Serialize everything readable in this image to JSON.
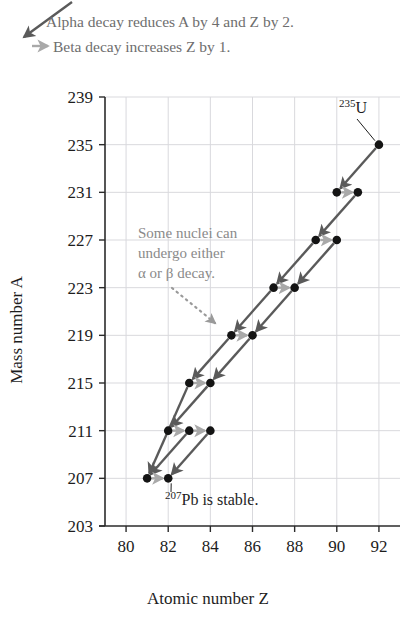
{
  "figure": {
    "legend": [
      {
        "id": "alpha",
        "icon": "alpha-decay-arrow-icon",
        "text": "Alpha decay reduces A by 4 and Z by 2.",
        "color": "#5a5a5a"
      },
      {
        "id": "beta",
        "icon": "beta-decay-arrow-icon",
        "text": "Beta decay increases Z by 1.",
        "color": "#a9a9a9"
      }
    ],
    "annotation": {
      "lines": [
        "Some nuclei can",
        "undergo either",
        "α or β decay."
      ],
      "color": "#8a8a8a",
      "points_to": {
        "Z": 85,
        "A": 219
      }
    },
    "callouts": [
      {
        "id": "u235",
        "sup": "235",
        "symbol": "U",
        "suffix": "",
        "Z": 92,
        "A": 235
      },
      {
        "id": "pb207",
        "sup": "207",
        "symbol": "Pb",
        "suffix": " is stable.",
        "Z": 82,
        "A": 207
      }
    ],
    "colors": {
      "alpha": "#5a5a5a",
      "beta": "#a9a9a9",
      "dot": "#141414",
      "grid": "#d9d9dd",
      "axis": "#2b2b2b",
      "annotation": "#8a8a8a"
    }
  },
  "chart_data": {
    "type": "scatter",
    "title": "",
    "xlabel": "Atomic number Z",
    "ylabel": "Mass number A",
    "xlim": [
      79,
      93
    ],
    "ylim": [
      203,
      239
    ],
    "xticks": [
      80,
      82,
      84,
      86,
      88,
      90,
      92
    ],
    "yticks": [
      203,
      207,
      211,
      215,
      219,
      223,
      227,
      231,
      235,
      239
    ],
    "grid": true,
    "legend_position": "above-plot",
    "points": [
      {
        "Z": 92,
        "A": 235,
        "label": "235U"
      },
      {
        "Z": 90,
        "A": 231,
        "label": ""
      },
      {
        "Z": 91,
        "A": 231,
        "label": ""
      },
      {
        "Z": 89,
        "A": 227,
        "label": ""
      },
      {
        "Z": 90,
        "A": 227,
        "label": ""
      },
      {
        "Z": 87,
        "A": 223,
        "label": ""
      },
      {
        "Z": 88,
        "A": 223,
        "label": ""
      },
      {
        "Z": 85,
        "A": 219,
        "label": ""
      },
      {
        "Z": 86,
        "A": 219,
        "label": ""
      },
      {
        "Z": 83,
        "A": 215,
        "label": ""
      },
      {
        "Z": 84,
        "A": 215,
        "label": ""
      },
      {
        "Z": 82,
        "A": 211,
        "label": ""
      },
      {
        "Z": 83,
        "A": 211,
        "label": ""
      },
      {
        "Z": 84,
        "A": 211,
        "label": ""
      },
      {
        "Z": 81,
        "A": 207,
        "label": ""
      },
      {
        "Z": 82,
        "A": 207,
        "label": "207Pb"
      }
    ],
    "transitions": [
      {
        "kind": "alpha",
        "from": {
          "Z": 92,
          "A": 235
        },
        "to": {
          "Z": 90,
          "A": 231
        }
      },
      {
        "kind": "beta",
        "from": {
          "Z": 90,
          "A": 231
        },
        "to": {
          "Z": 91,
          "A": 231
        }
      },
      {
        "kind": "alpha",
        "from": {
          "Z": 91,
          "A": 231
        },
        "to": {
          "Z": 89,
          "A": 227
        }
      },
      {
        "kind": "beta",
        "from": {
          "Z": 89,
          "A": 227
        },
        "to": {
          "Z": 90,
          "A": 227
        }
      },
      {
        "kind": "alpha",
        "from": {
          "Z": 90,
          "A": 227
        },
        "to": {
          "Z": 88,
          "A": 223
        }
      },
      {
        "kind": "alpha",
        "from": {
          "Z": 89,
          "A": 227
        },
        "to": {
          "Z": 87,
          "A": 223
        }
      },
      {
        "kind": "beta",
        "from": {
          "Z": 87,
          "A": 223
        },
        "to": {
          "Z": 88,
          "A": 223
        }
      },
      {
        "kind": "alpha",
        "from": {
          "Z": 88,
          "A": 223
        },
        "to": {
          "Z": 86,
          "A": 219
        }
      },
      {
        "kind": "alpha",
        "from": {
          "Z": 87,
          "A": 223
        },
        "to": {
          "Z": 85,
          "A": 219
        }
      },
      {
        "kind": "beta",
        "from": {
          "Z": 85,
          "A": 219
        },
        "to": {
          "Z": 86,
          "A": 219
        }
      },
      {
        "kind": "alpha",
        "from": {
          "Z": 86,
          "A": 219
        },
        "to": {
          "Z": 84,
          "A": 215
        }
      },
      {
        "kind": "alpha",
        "from": {
          "Z": 85,
          "A": 219
        },
        "to": {
          "Z": 83,
          "A": 215
        }
      },
      {
        "kind": "beta",
        "from": {
          "Z": 83,
          "A": 215
        },
        "to": {
          "Z": 84,
          "A": 215
        }
      },
      {
        "kind": "alpha",
        "from": {
          "Z": 84,
          "A": 215
        },
        "to": {
          "Z": 82,
          "A": 211
        }
      },
      {
        "kind": "alpha",
        "from": {
          "Z": 83,
          "A": 215
        },
        "to": {
          "Z": 81,
          "A": 207
        }
      },
      {
        "kind": "beta",
        "from": {
          "Z": 82,
          "A": 211
        },
        "to": {
          "Z": 83,
          "A": 211
        }
      },
      {
        "kind": "beta",
        "from": {
          "Z": 83,
          "A": 211
        },
        "to": {
          "Z": 84,
          "A": 211
        }
      },
      {
        "kind": "alpha",
        "from": {
          "Z": 84,
          "A": 211
        },
        "to": {
          "Z": 82,
          "A": 207
        }
      },
      {
        "kind": "alpha",
        "from": {
          "Z": 83,
          "A": 211
        },
        "to": {
          "Z": 81,
          "A": 207
        }
      },
      {
        "kind": "beta",
        "from": {
          "Z": 81,
          "A": 207
        },
        "to": {
          "Z": 82,
          "A": 207
        }
      }
    ]
  }
}
